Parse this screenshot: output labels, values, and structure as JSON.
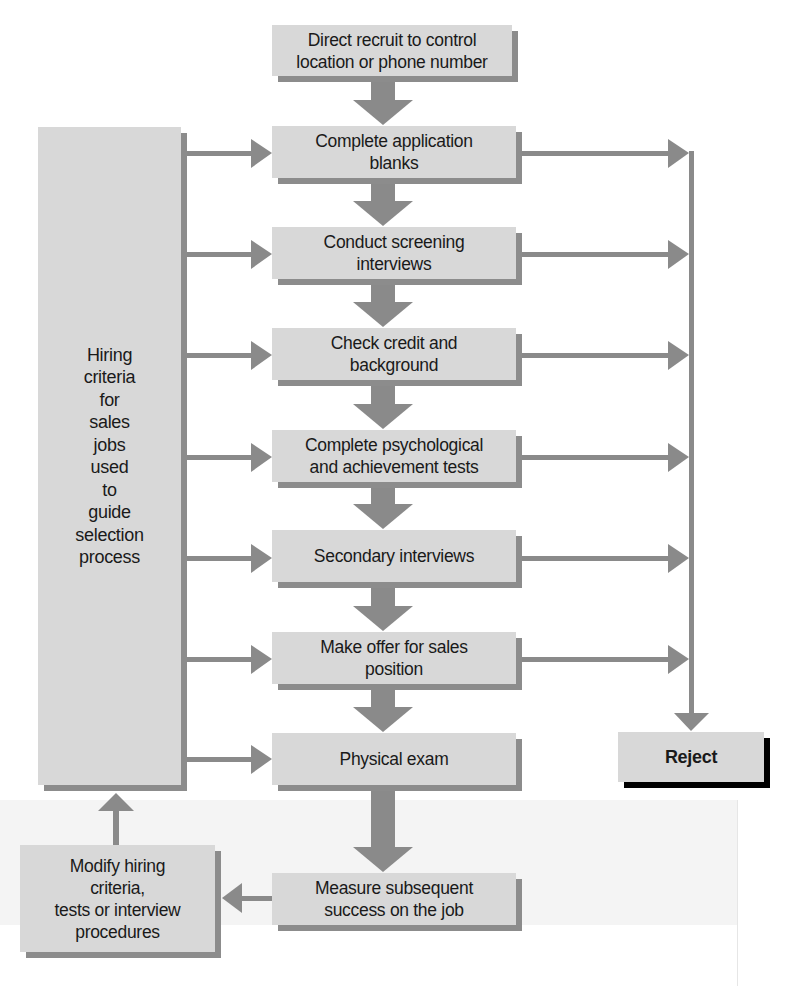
{
  "diagram": {
    "colors": {
      "box_fill": "#d8d8d8",
      "shadow": "#8c8c8c",
      "arrow": "#8a8a8a",
      "reject_shadow": "#000000",
      "text": "#1a1a1a"
    },
    "criteria_box": {
      "label": "Hiring\ncriteria\nfor\nsales\njobs\nused\nto\nguide\nselection\nprocess"
    },
    "modify_box": {
      "label": "Modify hiring\ncriteria,\ntests or interview\nprocedures"
    },
    "reject_box": {
      "label": "Reject"
    },
    "steps": [
      {
        "id": "direct-recruit",
        "label": "Direct recruit to control\nlocation or phone number"
      },
      {
        "id": "application-blanks",
        "label": "Complete application\nblanks"
      },
      {
        "id": "screening-interviews",
        "label": "Conduct screening\ninterviews"
      },
      {
        "id": "credit-background",
        "label": "Check credit and\nbackground"
      },
      {
        "id": "psych-tests",
        "label": "Complete psychological\nand achievement tests"
      },
      {
        "id": "secondary-interviews",
        "label": "Secondary interviews"
      },
      {
        "id": "make-offer",
        "label": "Make offer for sales\nposition"
      },
      {
        "id": "physical-exam",
        "label": "Physical exam"
      },
      {
        "id": "measure-success",
        "label": "Measure subsequent\nsuccess on the job"
      }
    ],
    "edges": [
      {
        "from": "direct-recruit",
        "to": "application-blanks"
      },
      {
        "from": "application-blanks",
        "to": "screening-interviews"
      },
      {
        "from": "screening-interviews",
        "to": "credit-background"
      },
      {
        "from": "credit-background",
        "to": "psych-tests"
      },
      {
        "from": "psych-tests",
        "to": "secondary-interviews"
      },
      {
        "from": "secondary-interviews",
        "to": "make-offer"
      },
      {
        "from": "make-offer",
        "to": "physical-exam"
      },
      {
        "from": "physical-exam",
        "to": "measure-success"
      },
      {
        "from": "measure-success",
        "to": "modify-criteria"
      },
      {
        "from": "modify-criteria",
        "to": "hiring-criteria"
      },
      {
        "from": "hiring-criteria",
        "to": "application-blanks"
      },
      {
        "from": "hiring-criteria",
        "to": "screening-interviews"
      },
      {
        "from": "hiring-criteria",
        "to": "credit-background"
      },
      {
        "from": "hiring-criteria",
        "to": "psych-tests"
      },
      {
        "from": "hiring-criteria",
        "to": "secondary-interviews"
      },
      {
        "from": "hiring-criteria",
        "to": "make-offer"
      },
      {
        "from": "hiring-criteria",
        "to": "physical-exam"
      },
      {
        "from": "application-blanks",
        "to": "reject"
      },
      {
        "from": "screening-interviews",
        "to": "reject"
      },
      {
        "from": "credit-background",
        "to": "reject"
      },
      {
        "from": "psych-tests",
        "to": "reject"
      },
      {
        "from": "secondary-interviews",
        "to": "reject"
      },
      {
        "from": "make-offer",
        "to": "reject"
      }
    ]
  }
}
